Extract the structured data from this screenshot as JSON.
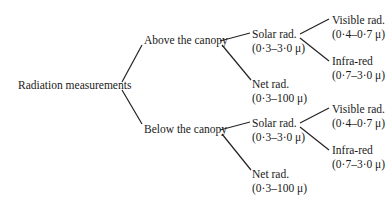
{
  "diagram": {
    "root": {
      "label": "Radiation measurements"
    },
    "above": {
      "label": "Above the canopy",
      "solar": {
        "label": "Solar rad.",
        "range": "(0·3–3·0 μ)",
        "visible": {
          "label": "Visible rad.",
          "range": "(0·4–0·7 μ)"
        },
        "infrared": {
          "label": "Infra-red",
          "range": "(0·7–3·0 μ)"
        }
      },
      "net": {
        "label": "Net rad.",
        "range": "(0·3–100 μ)"
      }
    },
    "below": {
      "label": "Below the canopy",
      "solar": {
        "label": "Solar rad.",
        "range": "(0·3–3·0 μ)",
        "visible": {
          "label": "Visible rad.",
          "range": "(0·4–0·7 μ)"
        },
        "infrared": {
          "label": "Infra-red",
          "range": "(0·7–3·0 μ)"
        }
      },
      "net": {
        "label": "Net rad.",
        "range": "(0·3–100 μ)"
      }
    }
  }
}
